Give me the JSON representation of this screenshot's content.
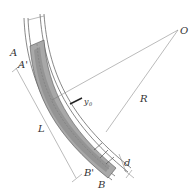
{
  "diagram": {
    "type": "curved channel lining cross-section",
    "labels": {
      "center": "O",
      "radius": "R",
      "section_a": "A",
      "section_a_prime": "A'",
      "length": "L",
      "section_b": "B",
      "section_b_prime": "B'",
      "thickness": "d",
      "offset": "y",
      "offset_sub": "0"
    },
    "colors": {
      "fill": "#a8a8a8",
      "fill_dark": "#8c8c8c",
      "stroke": "#555555",
      "background": "#ffffff"
    }
  }
}
